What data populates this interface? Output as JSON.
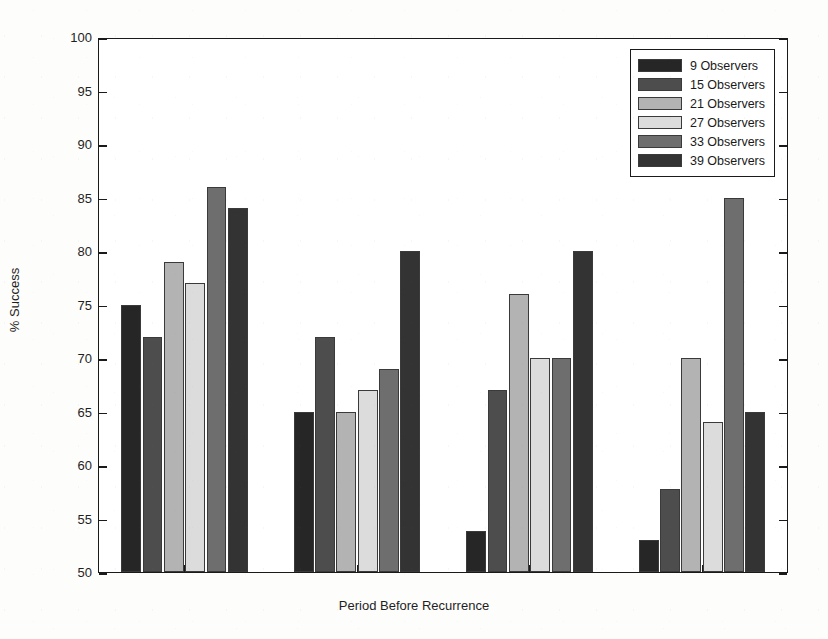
{
  "chart_data": {
    "type": "bar",
    "title": "",
    "xlabel": "Period Before Recurrence",
    "ylabel": "% Success",
    "ylim": [
      50,
      100
    ],
    "ytick_step": 5,
    "yticks": [
      50,
      55,
      60,
      65,
      70,
      75,
      80,
      85,
      90,
      95,
      100
    ],
    "categories": [
      "10",
      "20",
      "20",
      "40"
    ],
    "grid": false,
    "legend_position": "top-right",
    "series": [
      {
        "name": "9 Observers",
        "color": "#262626",
        "values": [
          75,
          65,
          53.8,
          53
        ]
      },
      {
        "name": "15 Observers",
        "color": "#4d4d4d",
        "values": [
          72,
          72,
          67,
          57.8
        ]
      },
      {
        "name": "21 Observers",
        "color": "#b3b3b3",
        "values": [
          79,
          65,
          76,
          70
        ]
      },
      {
        "name": "27 Observers",
        "color": "#dcdcdc",
        "values": [
          77,
          67,
          70,
          64
        ]
      },
      {
        "name": "33 Observers",
        "color": "#6e6e6e",
        "values": [
          86,
          69,
          70,
          85
        ]
      },
      {
        "name": "39 Observers",
        "color": "#333333",
        "values": [
          84,
          80,
          80,
          65
        ]
      }
    ]
  },
  "axes": {
    "ylabel": "% Success",
    "xlabel": "Period Before Recurrence"
  },
  "legend": {
    "entries": [
      {
        "label": "9 Observers"
      },
      {
        "label": "15 Observers"
      },
      {
        "label": "21 Observers"
      },
      {
        "label": "27 Observers"
      },
      {
        "label": "33 Observers"
      },
      {
        "label": "39 Observers"
      }
    ]
  }
}
